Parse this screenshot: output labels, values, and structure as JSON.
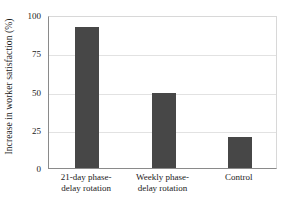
{
  "chart_data": {
    "type": "bar",
    "title": "",
    "xlabel": "",
    "ylabel": "Increase in worker satisfaction (%)",
    "categories": [
      "21-day phase-\ndelay rotation",
      "Weekly phase-\ndelay rotation",
      "Control"
    ],
    "values": [
      92,
      49,
      20
    ],
    "ylim": [
      0,
      100
    ],
    "yticks": [
      0,
      25,
      50,
      75,
      100
    ],
    "ytick_labels": [
      "0",
      "25",
      "50",
      "75",
      "100"
    ],
    "grid": true,
    "legend": false,
    "bar_color": "#474747",
    "gridline_color": "#e2e2e2",
    "axis_color": "#8a8a8a",
    "background": "#ffffff"
  },
  "axes": {
    "y_title": "Increase in worker satisfaction (%)"
  }
}
